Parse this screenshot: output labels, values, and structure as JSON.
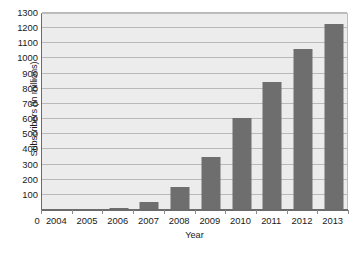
{
  "chart_data": {
    "type": "bar",
    "title": "",
    "subtitle": "",
    "xlabel": "Year",
    "ylabel": "Subscribers (in millions)",
    "categories": [
      "2004",
      "2005",
      "2006",
      "2007",
      "2008",
      "2009",
      "2010",
      "2011",
      "2012",
      "2013"
    ],
    "values": [
      1,
      5,
      12,
      50,
      150,
      350,
      605,
      845,
      1060,
      1230
    ],
    "series": [
      {
        "name": "Subscribers",
        "values": [
          1,
          5,
          12,
          50,
          150,
          350,
          605,
          845,
          1060,
          1230
        ]
      }
    ],
    "ylim": [
      0,
      1300
    ],
    "xlim_labels": [
      "2004",
      "2013"
    ],
    "y_ticks": [
      0,
      100,
      200,
      300,
      400,
      500,
      600,
      700,
      800,
      900,
      1000,
      1100,
      1200,
      1300
    ],
    "y_tick_labels": [
      "100",
      "200",
      "300",
      "400",
      "500",
      "600",
      "700",
      "800",
      "900",
      "1000",
      "1100",
      "1200",
      "1300"
    ],
    "y_origin_label": "0",
    "grid": true,
    "grid_axis": "y",
    "legend": false,
    "legend_position": "none",
    "annotations": []
  },
  "style": {
    "bar_color": "#6e6e6e",
    "plot_background": "#ececec",
    "page_background": "#ffffff",
    "gridline_color": "#b9b9b9",
    "axis_color": "#6b6b6b",
    "text_color": "#1a1a1a"
  }
}
